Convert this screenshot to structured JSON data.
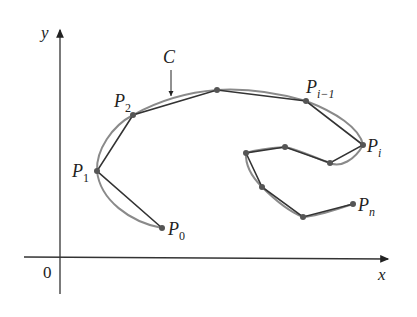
{
  "diagram": {
    "axes": {
      "x_label": "x",
      "y_label": "y",
      "origin_label": "0"
    },
    "curve_label": "C",
    "point_labels": {
      "p0": {
        "base": "P",
        "sub": "0"
      },
      "p1": {
        "base": "P",
        "sub": "1"
      },
      "p2": {
        "base": "P",
        "sub": "2"
      },
      "pim1": {
        "base": "P",
        "sub": "i−1"
      },
      "pi": {
        "base": "P",
        "sub": "i"
      },
      "pn": {
        "base": "P",
        "sub": "n"
      }
    },
    "polygon_points": [
      [
        162,
        228
      ],
      [
        97,
        171
      ],
      [
        133,
        115
      ],
      [
        217,
        90
      ],
      [
        306,
        101
      ],
      [
        363,
        145
      ],
      [
        330,
        163
      ],
      [
        285,
        147
      ],
      [
        246,
        153
      ],
      [
        262,
        187
      ],
      [
        303,
        217
      ],
      [
        353,
        204
      ]
    ],
    "colors": {
      "curve": "#8a8a8a",
      "polygon": "#333333",
      "points": "#555555",
      "axes": "#333333"
    }
  }
}
